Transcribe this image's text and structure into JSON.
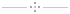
{
  "divider": {
    "type": "ornamental-separator",
    "line_color": "#c8c8c8",
    "dot_color": "#8a8a8a",
    "center_dot_color": "#b0b0b0",
    "dots": [
      {
        "name": "top",
        "x": 34,
        "y": 2
      },
      {
        "name": "left",
        "x": 30,
        "y": 6
      },
      {
        "name": "center",
        "x": 34,
        "y": 6
      },
      {
        "name": "right",
        "x": 38,
        "y": 6
      },
      {
        "name": "bottom",
        "x": 34,
        "y": 10
      }
    ]
  }
}
